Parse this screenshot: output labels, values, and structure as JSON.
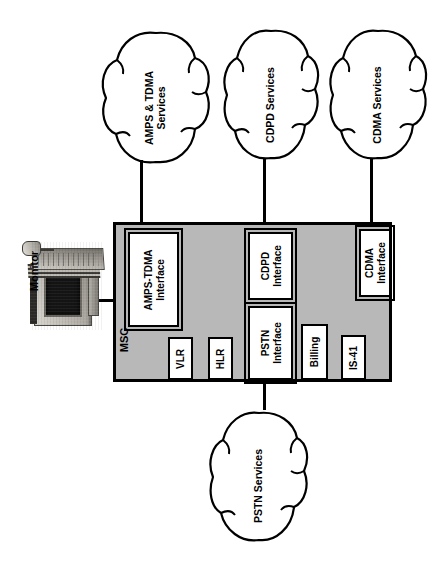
{
  "diagram": {
    "orientation": "rotated-90-ccw",
    "colors": {
      "msc_fill": "#b8b8b8",
      "component_fill": "#ffffff",
      "line": "#000000",
      "background": "#ffffff"
    }
  },
  "clouds": [
    {
      "id": "amps-tdma-services",
      "label": "AMPS & TDMA\nServices"
    },
    {
      "id": "cdpd-services",
      "label": "CDPD Services"
    },
    {
      "id": "cdma-services",
      "label": "CDMA Services"
    },
    {
      "id": "pstn-services",
      "label": "PSTN Services"
    }
  ],
  "msc": {
    "label": "MSC",
    "components": [
      {
        "id": "amps-tdma-interface",
        "label": "AMPS-TDMA\nInterface",
        "style": "double"
      },
      {
        "id": "vlr",
        "label": "VLR",
        "style": "single"
      },
      {
        "id": "hlr",
        "label": "HLR",
        "style": "single"
      },
      {
        "id": "cdpd-interface",
        "label": "CDPD\nInterface",
        "style": "double"
      },
      {
        "id": "pstn-interface",
        "label": "PSTN\nInterface",
        "style": "double"
      },
      {
        "id": "cdma-interface",
        "label": "CDMA\nInterface",
        "style": "double"
      },
      {
        "id": "billing",
        "label": "Billing",
        "style": "single"
      },
      {
        "id": "is-41",
        "label": "IS-41",
        "style": "single"
      }
    ]
  },
  "peripherals": [
    {
      "id": "monitor",
      "label": "Monitor"
    }
  ]
}
